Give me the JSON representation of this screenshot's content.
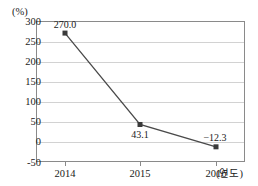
{
  "chart_data": {
    "type": "line",
    "title": "",
    "categories": [
      "2014",
      "2015",
      "2016"
    ],
    "values": [
      270.0,
      43.1,
      -12.3
    ],
    "point_labels": [
      "270.0",
      "43.1",
      "−12.3"
    ],
    "series": [
      {
        "name": "",
        "values": [
          270.0,
          43.1,
          -12.3
        ],
        "color": "#4a4a4a",
        "marker": "square"
      }
    ],
    "xlabel": "(연도)",
    "ylabel": "(%)",
    "ylim": [
      -50,
      300
    ],
    "ytick_labels": [
      "300",
      "250",
      "200",
      "150",
      "100",
      "50",
      "0",
      "-50"
    ],
    "ytick_values": [
      300,
      250,
      200,
      150,
      100,
      50,
      0,
      -50
    ],
    "ytick_step": 50,
    "grid": "horizontal",
    "legend": "none"
  },
  "axes": {
    "y_unit": "(%)",
    "x_unit": "(연도)"
  },
  "colors": {
    "line": "#4a4a4a",
    "marker": "#3a3a3a",
    "gridline": "#d2d2d2",
    "frame": "#8a8a8a",
    "text": "#1a1a1a",
    "background": "#ffffff"
  }
}
